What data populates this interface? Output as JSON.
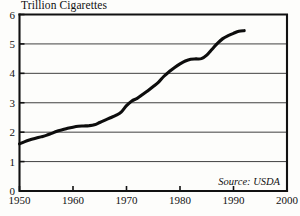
{
  "chart_data": {
    "type": "line",
    "title": "Trillion Cigarettes",
    "xlabel": "",
    "ylabel": "",
    "annotation": "Source: USDA",
    "grid": true,
    "legend": "none",
    "xlim": [
      1950,
      2000
    ],
    "ylim": [
      0,
      6
    ],
    "xticks": [
      "1950",
      "1960",
      "1970",
      "1980",
      "1990",
      "2000"
    ],
    "yticks": [
      "0",
      "1",
      "2",
      "3",
      "4",
      "5",
      "6"
    ],
    "series": [
      {
        "name": "World Cigarette Production",
        "x": [
          1950,
          1951,
          1952,
          1953,
          1954,
          1955,
          1956,
          1957,
          1958,
          1959,
          1960,
          1961,
          1962,
          1963,
          1964,
          1965,
          1966,
          1967,
          1968,
          1969,
          1970,
          1971,
          1972,
          1973,
          1974,
          1975,
          1976,
          1977,
          1978,
          1979,
          1980,
          1981,
          1982,
          1983,
          1984,
          1985,
          1986,
          1987,
          1988,
          1989,
          1990,
          1991,
          1992
        ],
        "values": [
          1.6,
          1.68,
          1.74,
          1.79,
          1.84,
          1.89,
          1.96,
          2.03,
          2.08,
          2.13,
          2.17,
          2.2,
          2.21,
          2.22,
          2.25,
          2.33,
          2.41,
          2.49,
          2.57,
          2.68,
          2.9,
          3.06,
          3.15,
          3.28,
          3.41,
          3.55,
          3.7,
          3.9,
          4.06,
          4.2,
          4.32,
          4.42,
          4.48,
          4.49,
          4.5,
          4.62,
          4.82,
          5.02,
          5.18,
          5.28,
          5.36,
          5.43,
          5.45
        ]
      }
    ]
  },
  "colors": {
    "line": "#0d0d0d",
    "axis": "#111111",
    "grid": "#2b2b2b",
    "background": "#fdfdfb"
  }
}
